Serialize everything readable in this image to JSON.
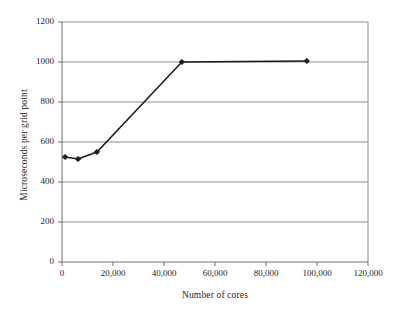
{
  "chart_data": {
    "type": "line",
    "title": "",
    "xlabel": "Number of cores",
    "ylabel": "Microseconds per grid point",
    "xlim": [
      0,
      120000
    ],
    "ylim": [
      0,
      1200
    ],
    "grid": true,
    "legend": false,
    "xticks": [
      "0",
      "20,000",
      "40,000",
      "60,000",
      "80,000",
      "100,000",
      "120,000"
    ],
    "xtick_values": [
      0,
      20000,
      40000,
      60000,
      80000,
      100000,
      120000
    ],
    "yticks": [
      "0",
      "200",
      "400",
      "600",
      "800",
      "1000",
      "1200"
    ],
    "ytick_values": [
      0,
      200,
      400,
      600,
      800,
      1000,
      1200
    ],
    "series": [
      {
        "name": "Microseconds per grid point",
        "color": "#1a1a1a",
        "marker": "diamond",
        "x": [
          1200,
          6300,
          13700,
          47000,
          96000
        ],
        "values": [
          525,
          515,
          550,
          1000,
          1005
        ]
      }
    ]
  }
}
